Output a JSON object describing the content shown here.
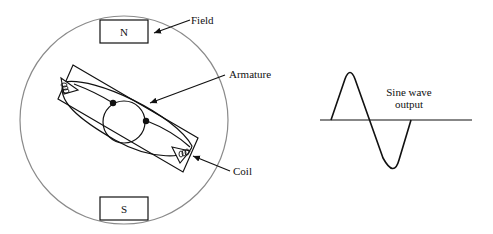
{
  "diagram": {
    "poles": {
      "north": "N",
      "south": "S"
    },
    "labels": {
      "field": "Field",
      "armature": "Armature",
      "coil": "Coil",
      "output_line1": "Sine wave",
      "output_line2": "output"
    },
    "colors": {
      "stroke": "#111111",
      "housing": "#8a8a8a",
      "background": "#ffffff"
    }
  }
}
